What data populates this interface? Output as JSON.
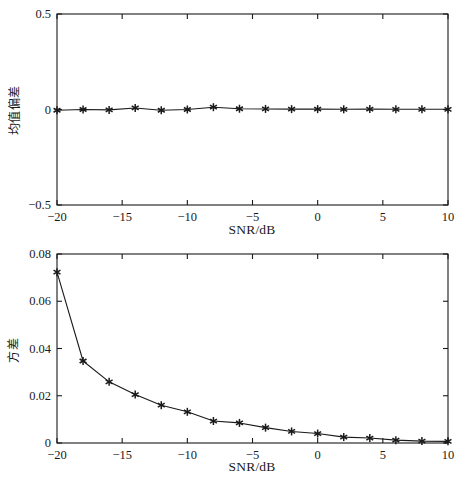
{
  "figure": {
    "background": "#ffffff",
    "line_color": "#1a1a1a",
    "marker": "star"
  },
  "chart_data": [
    {
      "type": "line",
      "id": "mean-bias-vs-snr",
      "title": "",
      "xlabel": "SNR/dB",
      "ylabel": "均值偏差",
      "xlim": [
        -20,
        10
      ],
      "ylim": [
        -0.5,
        0.5
      ],
      "xticks": [
        -20,
        -15,
        -10,
        -5,
        0,
        5,
        10
      ],
      "xtick_labels": [
        "−20",
        "−15",
        "−10",
        "−5",
        "0",
        "5",
        "10"
      ],
      "yticks": [
        -0.5,
        0,
        0.5
      ],
      "ytick_labels": [
        "−0.5",
        "0",
        "0.5"
      ],
      "grid": false,
      "legend": null,
      "marker": "star",
      "x": [
        -20,
        -18,
        -16,
        -14,
        -12,
        -10,
        -8,
        -6,
        -4,
        -2,
        0,
        2,
        4,
        6,
        8,
        10
      ],
      "values": [
        -0.004,
        0.0,
        -0.002,
        0.008,
        -0.004,
        0.0,
        0.012,
        0.004,
        0.003,
        0.002,
        0.002,
        0.001,
        0.002,
        0.001,
        0.001,
        0.001
      ]
    },
    {
      "type": "line",
      "id": "variance-vs-snr",
      "title": "",
      "xlabel": "SNR/dB",
      "ylabel": "方差",
      "xlim": [
        -20,
        10
      ],
      "ylim": [
        0,
        0.08
      ],
      "xticks": [
        -20,
        -15,
        -10,
        -5,
        0,
        5,
        10
      ],
      "xtick_labels": [
        "−20",
        "−15",
        "−10",
        "−5",
        "0",
        "5",
        "10"
      ],
      "yticks": [
        0,
        0.02,
        0.04,
        0.06,
        0.08
      ],
      "ytick_labels": [
        "0",
        "0.02",
        "0.04",
        "0.06",
        "0.08"
      ],
      "grid": false,
      "legend": null,
      "marker": "star",
      "x": [
        -20,
        -18,
        -16,
        -14,
        -12,
        -10,
        -8,
        -6,
        -4,
        -2,
        0,
        2,
        4,
        6,
        8,
        10
      ],
      "values": [
        0.0723,
        0.0347,
        0.0259,
        0.0205,
        0.016,
        0.0132,
        0.0093,
        0.0085,
        0.0065,
        0.0049,
        0.004,
        0.0025,
        0.0021,
        0.0012,
        0.0008,
        0.0007
      ]
    }
  ]
}
